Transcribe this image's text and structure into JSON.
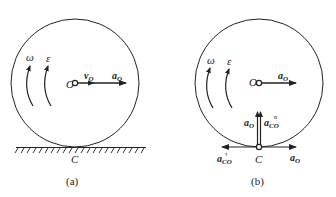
{
  "figure": {
    "panels": [
      {
        "id": "a",
        "caption": "(a)",
        "labels": {
          "omega": "ω",
          "epsilon": "ε",
          "center": "O",
          "velocity": "v",
          "velocity_sub": "O",
          "accel": "a",
          "accel_sub": "O",
          "contact": "C"
        }
      },
      {
        "id": "b",
        "caption": "(b)",
        "labels": {
          "omega": "ω",
          "epsilon": "ε",
          "center": "O",
          "accel_center": "a",
          "accel_center_sub": "O",
          "accel_up": "a",
          "accel_up_sub": "O",
          "accel_normal": "a",
          "accel_normal_sub": "CO",
          "accel_normal_sup": "n",
          "accel_tangent": "a",
          "accel_tangent_sub": "CO",
          "accel_tangent_sup": "τ",
          "accel_right": "a",
          "accel_right_sub": "O",
          "contact": "C"
        }
      }
    ],
    "colors": {
      "stroke": "#222222",
      "background": "#ffffff"
    }
  }
}
